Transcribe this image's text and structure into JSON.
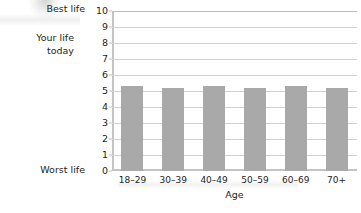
{
  "labels": {
    "best_life": "Best life",
    "worst_life": "Worst life",
    "your_life_line1": "Your life",
    "your_life_line2": "today"
  },
  "chart_data": {
    "type": "bar",
    "title": "",
    "subtitle": "",
    "xlabel": "Age",
    "ylabel": "",
    "categories": [
      "18–29",
      "30–39",
      "40–49",
      "50–59",
      "60–69",
      "70+"
    ],
    "values": [
      5.3,
      5.2,
      5.3,
      5.2,
      5.3,
      5.2
    ],
    "series": [
      {
        "name": "Your life today",
        "values": [
          5.3,
          5.2,
          5.3,
          5.2,
          5.3,
          5.2
        ]
      }
    ],
    "ylim": [
      0,
      10
    ],
    "yticks": [
      0,
      1,
      2,
      3,
      4,
      5,
      6,
      7,
      8,
      9,
      10
    ],
    "ytick_labels": [
      "0",
      "1",
      "2",
      "3",
      "4",
      "5",
      "6",
      "7",
      "8",
      "9",
      "10"
    ],
    "y_axis_endpoint_labels": {
      "max": "Best life",
      "min": "Worst life"
    },
    "grid": true,
    "grid_axis": "y",
    "legend": false,
    "legend_position": "none",
    "bar_color": "#a9a9a9",
    "gridline_color": "#d2d2d2",
    "axis_color": "#c4c4c4",
    "text_color": "#231f20",
    "background_color": "#ffffff"
  }
}
